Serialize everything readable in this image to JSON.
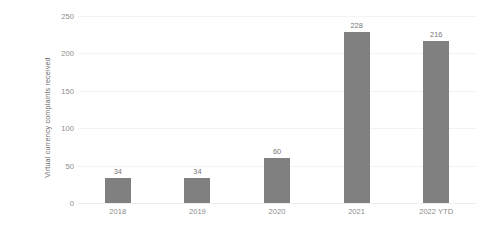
{
  "chart_data": {
    "type": "bar",
    "title": "",
    "xlabel": "",
    "ylabel": "Virtual currency complaints received",
    "categories": [
      "2018",
      "2019",
      "2020",
      "2021",
      "2022 YTD"
    ],
    "values": [
      34,
      34,
      60,
      228,
      216
    ],
    "data_labels": [
      "34",
      "34",
      "60",
      "228",
      "216"
    ],
    "ylim": [
      0,
      250
    ],
    "yticks": [
      0,
      50,
      100,
      150,
      200,
      250
    ],
    "ytick_labels": [
      "0",
      "50",
      "100",
      "150",
      "200",
      "250"
    ],
    "grid": true,
    "legend": false,
    "bar_color": "#808080",
    "gridline_color": "#f3f3f3",
    "tick_label_color": "#8c8c8c",
    "axis_title_color": "#6e6e6e",
    "background_color": "#ffffff"
  }
}
